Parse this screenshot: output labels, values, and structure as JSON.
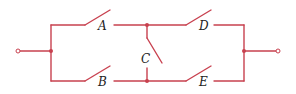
{
  "diagram": {
    "type": "switch-network",
    "wire_color": "#c8414f",
    "label_color": "#222222",
    "switches": [
      {
        "id": "A",
        "label": "A",
        "position": "top-left"
      },
      {
        "id": "B",
        "label": "B",
        "position": "bottom-left"
      },
      {
        "id": "C",
        "label": "C",
        "position": "middle-bridge"
      },
      {
        "id": "D",
        "label": "D",
        "position": "top-right"
      },
      {
        "id": "E",
        "label": "E",
        "position": "bottom-right"
      }
    ],
    "terminals": [
      "input-terminal",
      "output-terminal"
    ],
    "junctions": 4
  }
}
